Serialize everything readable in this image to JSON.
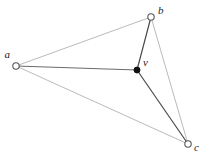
{
  "diagram": {
    "type": "graph",
    "title": "",
    "background_color": "#ffffff",
    "canvas": {
      "width": 207,
      "height": 164
    },
    "vertices": [
      {
        "id": "a",
        "label": "a",
        "x": 16,
        "y": 66,
        "style": "open-circle",
        "radius": 3.2,
        "stroke_color": "#555555",
        "fill_color": "#ffffff",
        "label_x": 10,
        "label_y": 58,
        "label_anchor": "end"
      },
      {
        "id": "b",
        "label": "b",
        "x": 151,
        "y": 17,
        "style": "open-circle",
        "radius": 3.2,
        "stroke_color": "#555555",
        "fill_color": "#ffffff",
        "label_x": 158,
        "label_y": 14,
        "label_anchor": "start"
      },
      {
        "id": "c",
        "label": "c",
        "x": 188,
        "y": 144,
        "style": "open-circle",
        "radius": 3.2,
        "stroke_color": "#555555",
        "fill_color": "#ffffff",
        "label_x": 194,
        "label_y": 151,
        "label_anchor": "start"
      },
      {
        "id": "v",
        "label": "v",
        "x": 137,
        "y": 70,
        "style": "filled-dot",
        "radius": 3.0,
        "stroke_color": "#111111",
        "fill_color": "#111111",
        "label_x": 143,
        "label_y": 66,
        "label_anchor": "start"
      }
    ],
    "edges": [
      {
        "id": "edge-a-b",
        "from": "a",
        "to": "b",
        "x1": 16,
        "y1": 66,
        "x2": 151,
        "y2": 17,
        "color": "#a8a8a8",
        "width": 0.8,
        "weight": "light"
      },
      {
        "id": "edge-a-c",
        "from": "a",
        "to": "c",
        "x1": 16,
        "y1": 66,
        "x2": 188,
        "y2": 144,
        "color": "#a8a8a8",
        "width": 0.8,
        "weight": "light"
      },
      {
        "id": "edge-b-c",
        "from": "b",
        "to": "c",
        "x1": 151,
        "y1": 17,
        "x2": 188,
        "y2": 144,
        "color": "#a8a8a8",
        "width": 0.8,
        "weight": "light"
      },
      {
        "id": "edge-a-v",
        "from": "a",
        "to": "v",
        "x1": 16,
        "y1": 66,
        "x2": 137,
        "y2": 70,
        "color": "#6b6b6b",
        "width": 1.1,
        "weight": "dark"
      },
      {
        "id": "edge-b-v",
        "from": "b",
        "to": "v",
        "x1": 151,
        "y1": 17,
        "x2": 137,
        "y2": 70,
        "color": "#4a4a4a",
        "width": 1.2,
        "weight": "dark"
      },
      {
        "id": "edge-v-c",
        "from": "v",
        "to": "c",
        "x1": 137,
        "y1": 70,
        "x2": 188,
        "y2": 144,
        "color": "#4a4a4a",
        "width": 1.2,
        "weight": "dark"
      }
    ]
  }
}
